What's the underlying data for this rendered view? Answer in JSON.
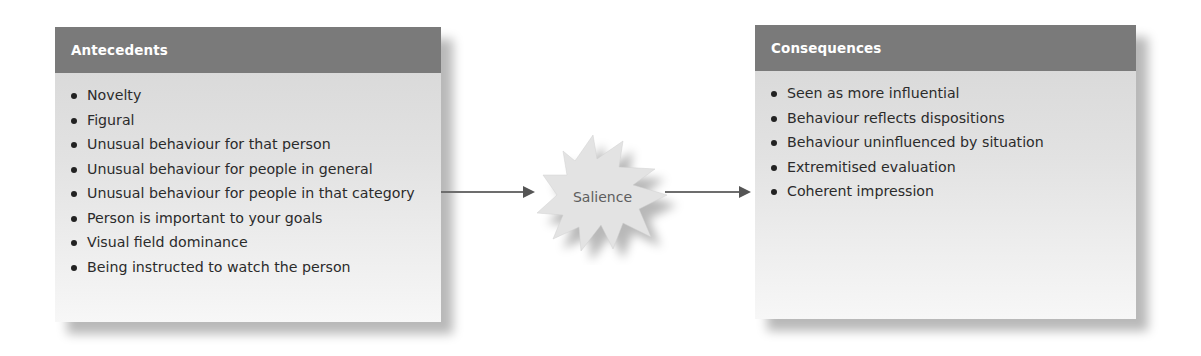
{
  "diagram": {
    "antecedents": {
      "title": "Antecedents",
      "items": [
        "Novelty",
        "Figural",
        "Unusual behaviour for that person",
        "Unusual behaviour for people in general",
        "Unusual behaviour for people in that category",
        "Person is important to your goals",
        "Visual field dominance",
        "Being instructed to watch the person"
      ]
    },
    "center": {
      "label": "Salience",
      "shape": "starburst"
    },
    "consequences": {
      "title": "Consequences",
      "items": [
        "Seen as more influential",
        "Behaviour reflects dispositions",
        "Behaviour uninfluenced by situation",
        "Extremitised evaluation",
        "Coherent impression"
      ]
    },
    "flow": [
      "Antecedents",
      "Salience",
      "Consequences"
    ],
    "colors": {
      "header_bg": "#7a7a7a",
      "header_text": "#ffffff",
      "panel_bg_top": "#d6d6d6",
      "panel_bg_bottom": "#f7f7f7",
      "arrow": "#6d6d6d",
      "burst_fill": "#e3e3e3"
    }
  }
}
